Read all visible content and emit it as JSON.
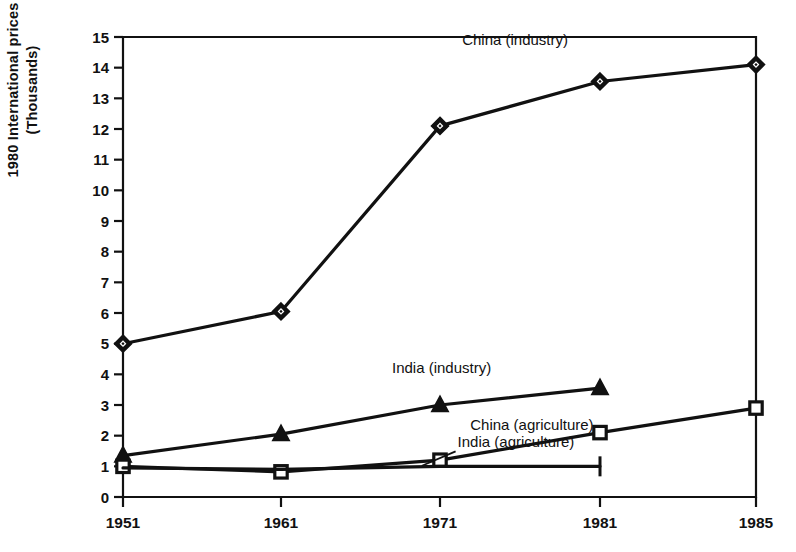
{
  "chart_data": {
    "type": "line",
    "title": "",
    "subtitle": "",
    "xlabel": "",
    "ylabel": "1980 International prices\n(Thousands)",
    "x": [
      1951,
      1961,
      1971,
      1981,
      1985
    ],
    "xtick_labels": [
      "1951",
      "1961",
      "1971",
      "1981",
      "1985"
    ],
    "ytick_labels": [
      "0",
      "1",
      "2",
      "3",
      "4",
      "5",
      "6",
      "7",
      "8",
      "9",
      "10",
      "11",
      "12",
      "13",
      "14",
      "15"
    ],
    "yticks": [
      0,
      1,
      2,
      3,
      4,
      5,
      6,
      7,
      8,
      9,
      10,
      11,
      12,
      13,
      14,
      15
    ],
    "ylim": [
      0,
      15
    ],
    "xlim": [
      1951,
      1985
    ],
    "grid": false,
    "legend": "inline-annotations",
    "series": [
      {
        "name": "China (industry)",
        "marker": "diamond",
        "x": [
          1951,
          1961,
          1971,
          1981,
          1985
        ],
        "values": [
          5.0,
          6.05,
          12.1,
          13.55,
          14.1
        ],
        "label_x": 1979.0,
        "label_y": 14.75,
        "label_anchor": "end"
      },
      {
        "name": "India (industry)",
        "marker": "triangle",
        "x": [
          1951,
          1961,
          1971,
          1981
        ],
        "values": [
          1.35,
          2.05,
          3.0,
          3.55
        ],
        "label_x": 1974.2,
        "label_y": 4.05,
        "label_anchor": "end"
      },
      {
        "name": "China (agriculture)",
        "marker": "square-open",
        "x": [
          1951,
          1961,
          1971,
          1981,
          1985
        ],
        "values": [
          1.0,
          0.82,
          1.2,
          2.1,
          2.9
        ],
        "label_x": 1980.6,
        "label_y": 2.2,
        "label_anchor": "end"
      },
      {
        "name": "India (agriculture)",
        "marker": "none",
        "x": [
          1951,
          1961,
          1971,
          1981
        ],
        "values": [
          0.95,
          0.9,
          1.0,
          1.0
        ],
        "label_x": 1972.1,
        "label_y": 1.62,
        "label_anchor": "start"
      }
    ]
  },
  "figure": {
    "axis_color": "#111111",
    "line_color": "#111111",
    "marker_fill": "#111111",
    "marker_open_fill": "#ffffff",
    "background": "#ffffff"
  }
}
